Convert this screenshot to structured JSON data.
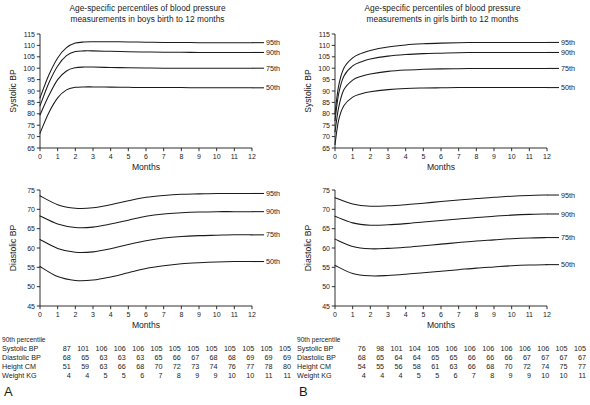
{
  "figure": {
    "panels": [
      {
        "letter": "A",
        "title": "Age-specific percentiles of blood pressure\nmeasurements in boys birth to 12 months",
        "title_line1": "Age-specific percentiles of blood pressure",
        "title_line2": "measurements in boys birth to 12 months",
        "charts": [
          {
            "id": "boys-systolic",
            "ylabel": "Systolic BP",
            "xlabel": "Months",
            "ylim": [
              65,
              115
            ],
            "yticks": [
              65,
              70,
              75,
              80,
              85,
              90,
              95,
              100,
              105,
              110,
              115
            ],
            "xlim": [
              0,
              12
            ],
            "xticks": [
              0,
              1,
              2,
              3,
              4,
              5,
              6,
              7,
              8,
              9,
              10,
              11,
              12
            ],
            "series_labels": [
              "95th",
              "90th",
              "75th",
              "50th"
            ]
          },
          {
            "id": "boys-diastolic",
            "ylabel": "Diastolic BP",
            "xlabel": "Months",
            "ylim": [
              45,
              75
            ],
            "yticks": [
              45,
              50,
              55,
              60,
              65,
              70,
              75
            ],
            "xlim": [
              0,
              12
            ],
            "xticks": [
              0,
              1,
              2,
              3,
              4,
              5,
              6,
              7,
              8,
              9,
              10,
              11,
              12
            ],
            "series_labels": [
              "95th",
              "90th",
              "75th",
              "50th"
            ]
          }
        ],
        "table": {
          "caption": "90th percentile",
          "rows": [
            {
              "label": "Systolic BP",
              "values": [
                87,
                101,
                106,
                106,
                106,
                105,
                105,
                105,
                105,
                105,
                105,
                105,
                105
              ]
            },
            {
              "label": "Diastolic BP",
              "values": [
                68,
                65,
                63,
                63,
                63,
                65,
                66,
                67,
                68,
                68,
                69,
                69,
                69
              ]
            },
            {
              "label": "Height CM",
              "values": [
                51,
                59,
                63,
                66,
                68,
                70,
                72,
                73,
                74,
                76,
                77,
                78,
                80
              ]
            },
            {
              "label": "Weight KG",
              "values": [
                4,
                4,
                5,
                5,
                6,
                7,
                8,
                9,
                9,
                10,
                10,
                11,
                11
              ]
            }
          ]
        }
      },
      {
        "letter": "B",
        "title": "Age-specific percentiles of blood pressure\nmeasurements in girls birth to 12 months",
        "title_line1": "Age-specific percentiles of blood pressure",
        "title_line2": "measurements in girls birth to 12 months",
        "charts": [
          {
            "id": "girls-systolic",
            "ylabel": "Systolic BP",
            "xlabel": "Months",
            "ylim": [
              65,
              115
            ],
            "yticks": [
              65,
              70,
              75,
              80,
              85,
              90,
              95,
              100,
              105,
              110,
              115
            ],
            "xlim": [
              0,
              12
            ],
            "xticks": [
              0,
              1,
              2,
              3,
              4,
              5,
              6,
              7,
              8,
              9,
              10,
              11,
              12
            ],
            "series_labels": [
              "95th",
              "90th",
              "75th",
              "50th"
            ]
          },
          {
            "id": "girls-diastolic",
            "ylabel": "Diastolic BP",
            "xlabel": "Months",
            "ylim": [
              45,
              75
            ],
            "yticks": [
              45,
              50,
              55,
              60,
              65,
              70,
              75
            ],
            "xlim": [
              0,
              12
            ],
            "xticks": [
              0,
              1,
              2,
              3,
              4,
              5,
              6,
              7,
              8,
              9,
              10,
              11,
              12
            ],
            "series_labels": [
              "95th",
              "90th",
              "75th",
              "50th"
            ]
          }
        ],
        "table": {
          "caption": "90th percentile",
          "rows": [
            {
              "label": "Systolic BP",
              "values": [
                76,
                98,
                101,
                104,
                105,
                106,
                106,
                106,
                106,
                106,
                106,
                105,
                105
              ]
            },
            {
              "label": "Diastolic BP",
              "values": [
                68,
                65,
                64,
                64,
                65,
                65,
                66,
                66,
                66,
                67,
                67,
                67,
                67
              ]
            },
            {
              "label": "Height CM",
              "values": [
                54,
                55,
                56,
                58,
                61,
                63,
                66,
                68,
                70,
                72,
                74,
                75,
                77
              ]
            },
            {
              "label": "Weight KG",
              "values": [
                4,
                4,
                4,
                5,
                5,
                6,
                7,
                8,
                9,
                9,
                10,
                10,
                11
              ]
            }
          ]
        }
      }
    ]
  },
  "chart_data": [
    {
      "id": "boys-systolic",
      "type": "line",
      "title": "Age-specific percentiles of blood pressure measurements in boys birth to 12 months",
      "xlabel": "Months",
      "ylabel": "Systolic BP",
      "xlim": [
        0,
        12
      ],
      "ylim": [
        65,
        115
      ],
      "xticks": [
        0,
        1,
        2,
        3,
        4,
        5,
        6,
        7,
        8,
        9,
        10,
        11,
        12
      ],
      "yticks": [
        65,
        70,
        75,
        80,
        85,
        90,
        95,
        100,
        105,
        110,
        115
      ],
      "grid": false,
      "legend_position": "right-inline",
      "x": [
        0,
        0.5,
        1,
        1.5,
        2,
        2.5,
        3,
        4,
        5,
        6,
        7,
        8,
        9,
        10,
        11,
        12
      ],
      "series": [
        {
          "name": "95th",
          "values": [
            87,
            97,
            104.5,
            109,
            111,
            111.5,
            111.6,
            111.6,
            111.5,
            111.4,
            111.3,
            111.3,
            111.2,
            111.2,
            111.2,
            111.2
          ]
        },
        {
          "name": "90th",
          "values": [
            83.5,
            93.5,
            101,
            105.5,
            107.3,
            107.6,
            107.6,
            107.4,
            107.2,
            107.1,
            107,
            107,
            106.9,
            106.9,
            106.9,
            106.9
          ]
        },
        {
          "name": "75th",
          "values": [
            79.5,
            88,
            95,
            98.8,
            100.2,
            100.5,
            100.5,
            100.3,
            100.2,
            100.1,
            100,
            100,
            100,
            100,
            100,
            100
          ]
        },
        {
          "name": "50th",
          "values": [
            71.5,
            80.5,
            87,
            90.5,
            91.6,
            91.8,
            91.8,
            91.7,
            91.6,
            91.5,
            91.5,
            91.5,
            91.4,
            91.4,
            91.4,
            91.4
          ]
        }
      ]
    },
    {
      "id": "boys-diastolic",
      "type": "line",
      "title": "Age-specific percentiles of blood pressure measurements in boys birth to 12 months",
      "xlabel": "Months",
      "ylabel": "Diastolic BP",
      "xlim": [
        0,
        12
      ],
      "ylim": [
        45,
        75
      ],
      "xticks": [
        0,
        1,
        2,
        3,
        4,
        5,
        6,
        7,
        8,
        9,
        10,
        11,
        12
      ],
      "yticks": [
        45,
        50,
        55,
        60,
        65,
        70,
        75
      ],
      "grid": false,
      "legend_position": "right-inline",
      "x": [
        0,
        1,
        2,
        3,
        4,
        5,
        6,
        7,
        8,
        9,
        10,
        11,
        12
      ],
      "series": [
        {
          "name": "95th",
          "values": [
            73.5,
            71.2,
            70.3,
            70.4,
            71.2,
            72.2,
            73.1,
            73.6,
            73.9,
            74,
            74.1,
            74.1,
            74.1
          ]
        },
        {
          "name": "90th",
          "values": [
            68.3,
            66.2,
            65.3,
            65.4,
            66.2,
            67.2,
            68.2,
            68.8,
            69.1,
            69.3,
            69.4,
            69.4,
            69.4
          ]
        },
        {
          "name": "75th",
          "values": [
            62.2,
            59.9,
            58.9,
            59,
            59.8,
            60.9,
            61.9,
            62.6,
            63,
            63.2,
            63.3,
            63.4,
            63.4
          ]
        },
        {
          "name": "50th",
          "values": [
            55.2,
            52.6,
            51.6,
            51.7,
            52.5,
            53.6,
            54.7,
            55.4,
            55.9,
            56.2,
            56.4,
            56.5,
            56.5
          ]
        }
      ]
    },
    {
      "id": "girls-systolic",
      "type": "line",
      "title": "Age-specific percentiles of blood pressure measurements in girls birth to 12 months",
      "xlabel": "Months",
      "ylabel": "Systolic BP",
      "xlim": [
        0,
        12
      ],
      "ylim": [
        65,
        115
      ],
      "xticks": [
        0,
        1,
        2,
        3,
        4,
        5,
        6,
        7,
        8,
        9,
        10,
        11,
        12
      ],
      "yticks": [
        65,
        70,
        75,
        80,
        85,
        90,
        95,
        100,
        105,
        110,
        115
      ],
      "grid": false,
      "legend_position": "right-inline",
      "x": [
        0,
        0.2,
        0.5,
        1,
        1.5,
        2,
        3,
        4,
        5,
        6,
        7,
        8,
        9,
        10,
        11,
        12
      ],
      "series": [
        {
          "name": "95th",
          "values": [
            80,
            92,
            100,
            104.5,
            106.5,
            107.8,
            109.3,
            110.2,
            110.7,
            111,
            111.2,
            111.3,
            111.3,
            111.3,
            111.3,
            111.3
          ]
        },
        {
          "name": "90th",
          "values": [
            77,
            88.5,
            96.5,
            101,
            102.8,
            104,
            105.3,
            106,
            106.4,
            106.6,
            106.8,
            106.9,
            106.9,
            106.9,
            106.9,
            106.9
          ]
        },
        {
          "name": "75th",
          "values": [
            72,
            82.5,
            90.5,
            94.8,
            96.5,
            97.5,
            98.6,
            99.2,
            99.5,
            99.7,
            99.8,
            99.9,
            99.9,
            99.9,
            99.9,
            99.9
          ]
        },
        {
          "name": "50th",
          "values": [
            66.5,
            77,
            83.5,
            87.3,
            88.8,
            89.7,
            90.6,
            91.1,
            91.3,
            91.4,
            91.5,
            91.5,
            91.5,
            91.5,
            91.5,
            91.5
          ]
        }
      ]
    },
    {
      "id": "girls-diastolic",
      "type": "line",
      "title": "Age-specific percentiles of blood pressure measurements in girls birth to 12 months",
      "xlabel": "Months",
      "ylabel": "Diastolic BP",
      "xlim": [
        45,
        75
      ],
      "ylim": [
        45,
        75
      ],
      "xticks": [
        0,
        1,
        2,
        3,
        4,
        5,
        6,
        7,
        8,
        9,
        10,
        11,
        12
      ],
      "yticks": [
        45,
        50,
        55,
        60,
        65,
        70,
        75
      ],
      "grid": false,
      "legend_position": "right-inline",
      "x": [
        0,
        1,
        2,
        3,
        4,
        5,
        6,
        7,
        8,
        9,
        10,
        11,
        12
      ],
      "series": [
        {
          "name": "95th",
          "values": [
            73,
            71.4,
            70.8,
            70.9,
            71.2,
            71.6,
            72,
            72.4,
            72.8,
            73.1,
            73.4,
            73.6,
            73.7
          ]
        },
        {
          "name": "90th",
          "values": [
            68.2,
            66.5,
            65.9,
            66,
            66.3,
            66.7,
            67.1,
            67.5,
            67.9,
            68.2,
            68.5,
            68.7,
            68.8
          ]
        },
        {
          "name": "75th",
          "values": [
            62.3,
            60.4,
            59.8,
            59.9,
            60.2,
            60.6,
            61,
            61.4,
            61.8,
            62.1,
            62.4,
            62.6,
            62.7
          ]
        },
        {
          "name": "50th",
          "values": [
            55.5,
            53.4,
            52.8,
            52.9,
            53.2,
            53.6,
            54,
            54.4,
            54.8,
            55.1,
            55.4,
            55.6,
            55.7
          ]
        }
      ]
    }
  ]
}
